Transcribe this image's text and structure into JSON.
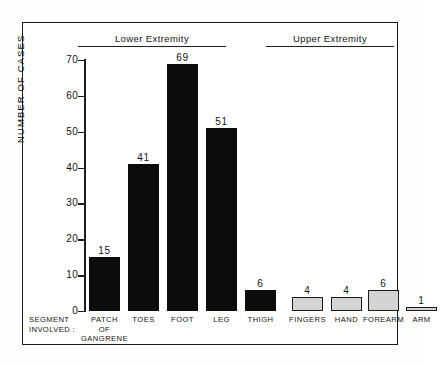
{
  "chart_data": {
    "type": "bar",
    "title": "",
    "xlabel": "SEGMENT INVOLVED :",
    "ylabel": "NUMBER OF CASES",
    "ylim": [
      0,
      70
    ],
    "yticks": [
      0,
      10,
      20,
      30,
      40,
      50,
      60,
      70
    ],
    "ytick_labels": [
      "0",
      "10",
      "20",
      "30",
      "40",
      "50",
      "60",
      "70"
    ],
    "grid": false,
    "legend": "none",
    "categories": [
      "PATCH\nOF\nGANGRENE",
      "TOES",
      "FOOT",
      "LEG",
      "THIGH",
      "FINGERS",
      "HAND",
      "FOREARM",
      "ARM"
    ],
    "values": [
      15,
      41,
      69,
      51,
      6,
      4,
      4,
      6,
      1
    ],
    "value_labels": [
      "15",
      "41",
      "69",
      "51",
      "6",
      "4",
      "4",
      "6",
      "1"
    ],
    "groups": [
      {
        "label": "Lower Extremity",
        "members": [
          "PATCH OF GANGRENE",
          "TOES",
          "FOOT",
          "LEG",
          "THIGH"
        ]
      },
      {
        "label": "Upper Extremity",
        "members": [
          "FINGERS",
          "HAND",
          "FOREARM",
          "ARM"
        ]
      }
    ],
    "series_styles": [
      {
        "name": "Lower Extremity",
        "fill": "#0c0c0c",
        "edge": "#0c0c0c"
      },
      {
        "name": "Upper Extremity",
        "fill": "#d4d4d4",
        "edge": "#1a1a1a"
      }
    ]
  },
  "groups": {
    "lower": "Lower Extremity",
    "upper": "Upper Extremity"
  },
  "axis": {
    "y_title": "NUMBER OF CASES",
    "y_labels": [
      "70",
      "60",
      "50",
      "40",
      "30",
      "20",
      "10",
      "0"
    ],
    "segment_caption": "SEGMENT\nINVOLVED :"
  },
  "bars": [
    {
      "label": "PATCH\nOF\nGANGRENE",
      "value": "15",
      "style": "dark"
    },
    {
      "label": "TOES",
      "value": "41",
      "style": "dark"
    },
    {
      "label": "FOOT",
      "value": "69",
      "style": "dark"
    },
    {
      "label": "LEG",
      "value": "51",
      "style": "dark"
    },
    {
      "label": "THIGH",
      "value": "6",
      "style": "dark"
    },
    {
      "label": "FINGERS",
      "value": "4",
      "style": "light"
    },
    {
      "label": "HAND",
      "value": "4",
      "style": "light"
    },
    {
      "label": "FOREARM",
      "value": "6",
      "style": "light"
    },
    {
      "label": "ARM",
      "value": "1",
      "style": "light"
    }
  ],
  "colors": {
    "bar_dark": "#0c0c0c",
    "bar_light": "#d4d4d4",
    "bar_light_edge": "#1a1a1a",
    "axis": "#1e1e1e",
    "frame": "#1a1a1a",
    "text": "#141414",
    "background": "#ffffff"
  }
}
